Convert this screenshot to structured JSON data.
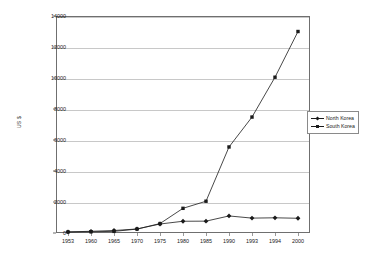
{
  "chart_data": {
    "type": "line",
    "title": "",
    "xlabel": "",
    "ylabel": "US $",
    "categories": [
      "1953",
      "1960",
      "1965",
      "1970",
      "1975",
      "1980",
      "1985",
      "1990",
      "1993",
      "1994",
      "2000"
    ],
    "series": [
      {
        "name": "North Korea",
        "marker": "diamond",
        "values": [
          70,
          110,
          160,
          260,
          580,
          758,
          765,
          1100,
          960,
          980,
          950
        ]
      },
      {
        "name": "South Korea",
        "marker": "square",
        "values": [
          67,
          80,
          105,
          253,
          608,
          1592,
          2050,
          5550,
          7480,
          10050,
          13000
        ]
      }
    ],
    "ylim": [
      0,
      14000
    ],
    "yticks": [
      0,
      2000,
      4000,
      6000,
      8000,
      10000,
      12000,
      14000
    ],
    "ytick_labels": [
      "0",
      "2000",
      "4000",
      "6000",
      "8000",
      "10000",
      "12000",
      "14000"
    ],
    "grid": true,
    "legend_position": "right",
    "line_color": "#1a1a1a",
    "grid_color": "#c8c8c8",
    "axis_color": "#6f6f6f",
    "background": "#ffffff"
  }
}
